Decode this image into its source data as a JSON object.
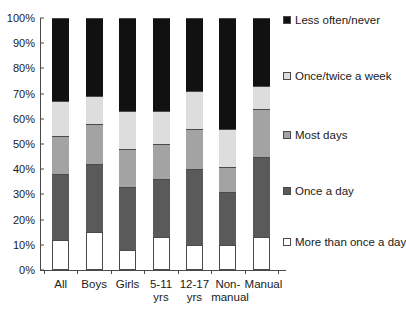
{
  "chart_data": {
    "type": "bar",
    "stacked": true,
    "stack_mode": "percent",
    "title": "",
    "subtitle": "",
    "xlabel": "",
    "ylabel": "",
    "ylim": [
      0,
      100
    ],
    "yticks": [
      "0%",
      "10%",
      "20%",
      "30%",
      "40%",
      "50%",
      "60%",
      "70%",
      "80%",
      "90%",
      "100%"
    ],
    "ytick_values": [
      0,
      10,
      20,
      30,
      40,
      50,
      60,
      70,
      80,
      90,
      100
    ],
    "grid": false,
    "legend_position": "right",
    "categories": [
      "All",
      "Boys",
      "Girls",
      "5-11\nyrs",
      "12-17\nyrs",
      "Non-\nmanual",
      "Manual"
    ],
    "series": [
      {
        "name": "More than once a day",
        "color": "#ffffff",
        "values": [
          12,
          15,
          8,
          13,
          10,
          10,
          13
        ]
      },
      {
        "name": "Once a day",
        "color": "#5a5a5a",
        "values": [
          26,
          27,
          25,
          23,
          30,
          21,
          32
        ]
      },
      {
        "name": "Most days",
        "color": "#a3a3a3",
        "values": [
          15,
          16,
          15,
          14,
          16,
          10,
          19
        ]
      },
      {
        "name": "Once/twice a week",
        "color": "#dddddd",
        "values": [
          14,
          11,
          15,
          13,
          15,
          15,
          9
        ]
      },
      {
        "name": "Less often/never",
        "color": "#111111",
        "values": [
          33,
          31,
          37,
          37,
          29,
          44,
          27
        ]
      }
    ],
    "cumulative_tops": {
      "All": [
        12,
        38,
        53,
        67,
        100
      ],
      "Boys": [
        15,
        42,
        58,
        69,
        100
      ],
      "Girls": [
        8,
        33,
        48,
        63,
        100
      ],
      "5-11 yrs": [
        13,
        36,
        50,
        63,
        100
      ],
      "12-17 yrs": [
        10,
        40,
        56,
        71,
        100
      ],
      "Non-manual": [
        10,
        31,
        41,
        56,
        100
      ],
      "Manual": [
        13,
        45,
        64,
        73,
        100
      ]
    },
    "legend": [
      {
        "label": "Less often/never",
        "color": "#111111"
      },
      {
        "label": "Once/twice a week",
        "color": "#dddddd"
      },
      {
        "label": "Most days",
        "color": "#a3a3a3"
      },
      {
        "label": "Once a day",
        "color": "#5a5a5a"
      },
      {
        "label": "More than once a day",
        "color": "#ffffff"
      }
    ],
    "axis_color": "#4a4a4a"
  }
}
